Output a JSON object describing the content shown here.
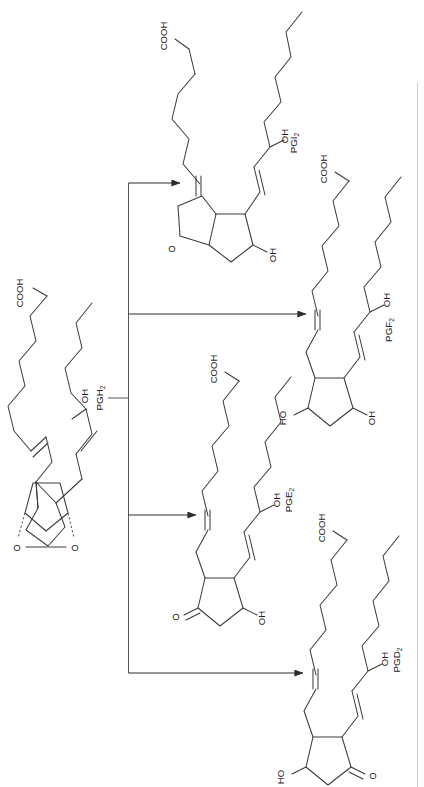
{
  "figure": {
    "kind": "chemical-reaction-scheme",
    "orientation": "rotated-90-clockwise",
    "background_color": "#ffffff",
    "line_color": "#3b3b3b",
    "page_border_color": "#cfcfcf"
  },
  "labels": {
    "pgh2": "PGH",
    "pgh2_sub": "2",
    "pgi2": "PGI",
    "pgi2_sub": "2",
    "pgf2": "PGF",
    "pgf2_sub": "2",
    "pge2": "PGE",
    "pge2_sub": "2",
    "pgd2": "PGD",
    "pgd2_sub": "2",
    "cooh": "COOH",
    "oh": "OH",
    "ho": "HO",
    "o": "O"
  },
  "structures": [
    {
      "id": "pgh2",
      "name": "PGH",
      "subscript": "2",
      "role": "substrate",
      "ring": "cyclopentane with 2,3-endoperoxide bridge",
      "substituents": [
        "COOH",
        "OH",
        "O",
        "O"
      ],
      "atom_labels": [
        "COOH",
        "OH",
        "O",
        "O"
      ]
    },
    {
      "id": "pgi2",
      "name": "PGI",
      "subscript": "2",
      "role": "product",
      "ring": "bicyclic furan-fused cyclopentane",
      "substituents": [
        "COOH",
        "OH",
        "OH",
        "O"
      ],
      "atom_labels": [
        "COOH",
        "OH",
        "OH",
        "O"
      ]
    },
    {
      "id": "pgf2",
      "name": "PGF",
      "subscript": "2",
      "role": "product",
      "ring": "cyclopentane 1,3-diol",
      "substituents": [
        "COOH",
        "OH",
        "HO",
        "OH"
      ],
      "atom_labels": [
        "COOH",
        "OH",
        "HO",
        "OH"
      ]
    },
    {
      "id": "pge2",
      "name": "PGE",
      "subscript": "2",
      "role": "product",
      "ring": "cyclopentanone with hydroxyl",
      "substituents": [
        "COOH",
        "OH",
        "OH",
        "O"
      ],
      "atom_labels": [
        "COOH",
        "OH",
        "OH",
        "O"
      ]
    },
    {
      "id": "pgd2",
      "name": "PGD",
      "subscript": "2",
      "role": "product",
      "ring": "cyclopentanone with hydroxyl",
      "substituents": [
        "COOH",
        "OH",
        "HO",
        "O"
      ],
      "atom_labels": [
        "COOH",
        "OH",
        "HO",
        "O"
      ]
    }
  ],
  "arrows": [
    {
      "id": "to-pgi2",
      "from": "pgh2",
      "to": "pgi2"
    },
    {
      "id": "to-pgf2",
      "from": "pgh2",
      "to": "pgf2"
    },
    {
      "id": "to-pge2",
      "from": "pgh2",
      "to": "pge2"
    },
    {
      "id": "to-pgd2",
      "from": "pgh2",
      "to": "pgd2"
    }
  ]
}
